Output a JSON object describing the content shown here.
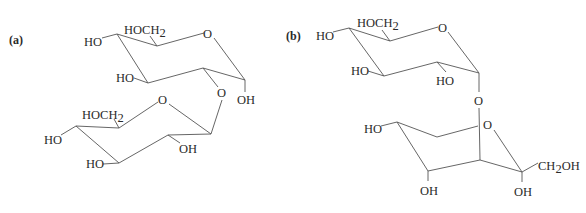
{
  "panels": [
    {
      "label": "(a)",
      "upper_ring": {
        "ring_oxygen": "O",
        "c4_substituent": "HO",
        "c6_group_main": "HOCH",
        "c6_group_sub": "2",
        "c3_substituent": "HO",
        "anomeric_substituent": "OH",
        "glycosidic_oxygen": "O"
      },
      "lower_ring": {
        "ring_oxygen": "O",
        "c6_group_main": "HOCH",
        "c6_group_sub": "2",
        "c4_substituent": "HO",
        "c3_substituent": "HO",
        "c2_substituent": "OH"
      }
    },
    {
      "label": "(b)",
      "upper_ring": {
        "ring_oxygen": "O",
        "c4_substituent": "HO",
        "c6_group_main": "HOCH",
        "c6_group_sub": "2",
        "c3_substituent": "HO",
        "c2_substituent": "HO",
        "glycosidic_oxygen": "O"
      },
      "lower_ring": {
        "ring_oxygen": "O",
        "left_substituent": "HO",
        "bottom_substituent": "OH",
        "anomeric_substituent": "OH",
        "side_chain_main": "CH",
        "side_chain_sub": "2",
        "side_chain_end": "OH"
      }
    }
  ],
  "colors": {
    "background": "#ffffff",
    "ink": "#2a2a2a",
    "bond": "#555555"
  }
}
